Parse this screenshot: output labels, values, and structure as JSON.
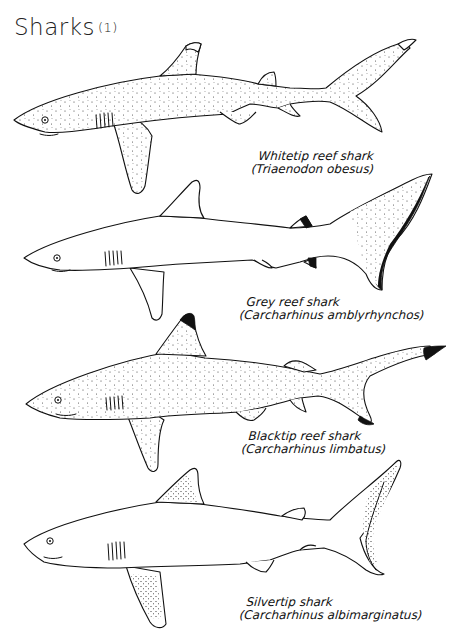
{
  "title": {
    "text": "Sharks",
    "part": "(1)"
  },
  "sharks": [
    {
      "common_name": "Whitetip reef shark",
      "scientific_name": "(Triaenodon obesus)",
      "pattern": "white-tipped first dorsal and upper caudal lobe, stippled body"
    },
    {
      "common_name": "Grey reef shark",
      "scientific_name": "(Carcharhinus amblyrhynchos)",
      "pattern": "black trailing edge of caudal fin, dark second dorsal and anal fin tips"
    },
    {
      "common_name": "Blacktip reef shark",
      "scientific_name": "(Carcharhinus limbatus)",
      "pattern": "black tips on first dorsal and caudal lobes, stippled body"
    },
    {
      "common_name": "Silvertip shark",
      "scientific_name": "(Carcharhinus albimarginatus)",
      "pattern": "white-edged fin tips with stippled fin margins"
    }
  ],
  "colors": {
    "ink": "#111111",
    "paper": "#ffffff"
  }
}
